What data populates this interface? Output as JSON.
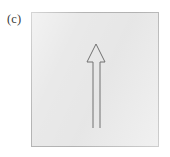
{
  "figure": {
    "panel_label": "(c)",
    "caption_text": "(c)",
    "background_color": "#ffffff",
    "box": {
      "fill_color": "#e9e9e9",
      "border_color": "#b4b4b4",
      "x": 31,
      "y": 12,
      "width": 128,
      "height": 135
    },
    "arrow": {
      "name": "upward-arrow",
      "direction": "up",
      "style": "outline",
      "stroke_color": "#707070",
      "stroke_width": 1,
      "fill": "none",
      "apex_x": 96,
      "apex_y": 44,
      "head_base_y": 62,
      "head_left_x": 87,
      "head_right_x": 105,
      "shaft_left_x": 93,
      "shaft_right_x": 100,
      "shaft_bottom_y": 128
    }
  }
}
